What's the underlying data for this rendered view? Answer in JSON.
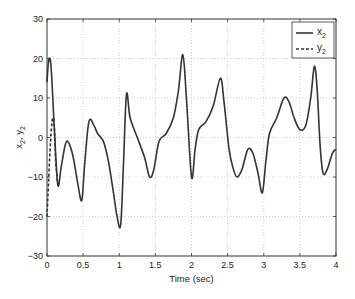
{
  "chart_data": {
    "type": "line",
    "title": "",
    "xlabel": "Time (sec)",
    "ylabel": "x2, y2",
    "xlim": [
      0,
      4
    ],
    "ylim": [
      -30,
      30
    ],
    "grid": true,
    "legend_position": "upper right",
    "x_ticks": [
      "0",
      "0.5",
      "1",
      "1.5",
      "2",
      "2.5",
      "3",
      "3.5",
      "4"
    ],
    "y_ticks": [
      "30",
      "20",
      "10",
      "0",
      "-10",
      "-20",
      "-30"
    ],
    "series": [
      {
        "name": "x2",
        "style": "solid",
        "color": "#333333",
        "x": [
          0,
          0.02,
          0.04,
          0.06,
          0.1,
          0.15,
          0.2,
          0.27,
          0.35,
          0.42,
          0.48,
          0.52,
          0.58,
          0.65,
          0.7,
          0.78,
          0.85,
          0.92,
          0.97,
          1.02,
          1.06,
          1.1,
          1.15,
          1.25,
          1.35,
          1.42,
          1.48,
          1.55,
          1.65,
          1.75,
          1.82,
          1.88,
          1.93,
          2.0,
          2.05,
          2.1,
          2.2,
          2.3,
          2.4,
          2.45,
          2.52,
          2.58,
          2.63,
          2.7,
          2.78,
          2.85,
          2.92,
          2.98,
          3.03,
          3.08,
          3.18,
          3.28,
          3.35,
          3.42,
          3.5,
          3.58,
          3.65,
          3.7,
          3.74,
          3.78,
          3.82,
          3.88,
          3.95,
          4.0
        ],
        "y": [
          14,
          19,
          20,
          17,
          3,
          -12,
          -7,
          -1,
          -4,
          -11,
          -16,
          -7,
          4,
          3,
          1,
          -1,
          -6,
          -14,
          -20,
          -22,
          -6,
          11,
          5,
          0,
          -5,
          -10,
          -8,
          -1,
          1,
          5,
          12,
          21,
          10,
          -10,
          -3,
          2,
          4,
          8,
          15,
          9,
          -3,
          -8,
          -10,
          -8,
          -3,
          -4,
          -9,
          -14,
          -6,
          1,
          5,
          10,
          9,
          5,
          2,
          3,
          10,
          18,
          12,
          -2,
          -9,
          -8,
          -4,
          -3
        ]
      },
      {
        "name": "y2",
        "style": "dashed",
        "color": "#333333",
        "x": [
          0,
          0.02,
          0.04,
          0.06,
          0.08,
          0.1,
          0.12,
          0.15
        ],
        "y": [
          -20,
          -12,
          -4,
          2,
          5,
          3,
          -6,
          -12
        ]
      }
    ]
  },
  "legend": {
    "items": [
      {
        "label": "x",
        "sub": "2",
        "style": "solid"
      },
      {
        "label": "y",
        "sub": "2",
        "style": "dashed"
      }
    ]
  },
  "axes": {
    "xlabel": "Time (sec)",
    "ylabel_main1": "x",
    "ylabel_sub1": "2",
    "ylabel_sep": ", ",
    "ylabel_main2": "y",
    "ylabel_sub2": "2"
  }
}
